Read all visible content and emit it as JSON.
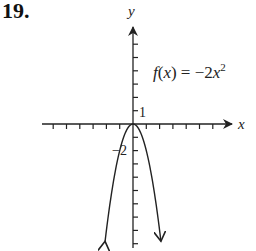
{
  "problem": {
    "number": "19."
  },
  "chart_data": {
    "type": "line",
    "title": "",
    "function_label": "f(x) = −2x²",
    "function_label_parts": {
      "lhs": "f(x) = −2x",
      "exp": "2"
    },
    "xlabel": "x",
    "ylabel": "y",
    "y_tick_labels": {
      "positive": "1",
      "negative": "−2"
    },
    "xlim": [
      -6,
      7
    ],
    "ylim": [
      -9,
      7
    ],
    "x_ticks": [
      -6,
      -5,
      -4,
      -3,
      -2,
      -1,
      1,
      2,
      3,
      4,
      5,
      6
    ],
    "y_ticks": [
      -9,
      -8,
      -7,
      -6,
      -5,
      -4,
      -3,
      -2,
      -1,
      1,
      2,
      3,
      4,
      5,
      6
    ],
    "series": [
      {
        "name": "f(x) = -2x^2",
        "x": [
          -2.1,
          -2,
          -1.5,
          -1,
          -0.5,
          0,
          0.5,
          1,
          1.5,
          2,
          2.1
        ],
        "y": [
          -8.82,
          -8,
          -4.5,
          -2,
          -0.5,
          0,
          -0.5,
          -2,
          -4.5,
          -8,
          -8.82
        ]
      }
    ],
    "vertex": [
      0,
      0
    ],
    "grid": false,
    "arrows_on_ends": true,
    "colors": {
      "axis": "#222222",
      "curve": "#222222"
    }
  }
}
